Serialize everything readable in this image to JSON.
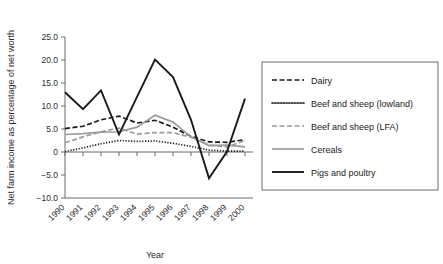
{
  "chart_data": {
    "type": "line",
    "title": "",
    "xlabel": "Year",
    "ylabel": "Net farm income as percentage of net worth",
    "x": [
      1990,
      1991,
      1992,
      1993,
      1994,
      1995,
      1996,
      1997,
      1998,
      1999,
      2000
    ],
    "categories": [
      "1990",
      "1991",
      "1992",
      "1993",
      "1994",
      "1995",
      "1996",
      "1997",
      "1998",
      "1999",
      "2000"
    ],
    "xlim": [
      1990,
      2000
    ],
    "ylim": [
      -10.0,
      25.0
    ],
    "yticks": [
      -10.0,
      -5.0,
      0,
      5.0,
      10.0,
      15.0,
      20.0,
      25.0
    ],
    "ytick_labels": [
      "−10.0",
      "−5.0",
      "0",
      "5.0",
      "10.0",
      "15.0",
      "20.0",
      "25.0"
    ],
    "xtick_labels": [
      "1990",
      "1991",
      "1992",
      "1993",
      "1994",
      "1995",
      "1996",
      "1997",
      "1998",
      "1999",
      "2000"
    ],
    "grid": false,
    "legend_position": "right",
    "series": [
      {
        "name": "Dairy",
        "style": "dashed",
        "color": "#1a1a1a",
        "values": [
          5.1,
          5.6,
          7.0,
          7.8,
          6.3,
          6.9,
          5.4,
          3.4,
          2.2,
          2.1,
          2.7
        ]
      },
      {
        "name": "Beef and sheep (lowland)",
        "style": "dotted",
        "color": "#1a1a1a",
        "values": [
          0.1,
          0.9,
          1.8,
          2.5,
          2.3,
          2.4,
          1.9,
          1.2,
          0.4,
          0.2,
          0.2
        ]
      },
      {
        "name": "Beef and sheep (LFA)",
        "style": "dashed",
        "color": "#9b9b9b",
        "values": [
          2.0,
          3.3,
          4.4,
          5.2,
          3.9,
          4.2,
          4.2,
          3.2,
          1.5,
          1.1,
          2.5
        ]
      },
      {
        "name": "Cereals",
        "style": "solid",
        "color": "#9b9b9b",
        "values": [
          3.8,
          4.0,
          4.3,
          4.4,
          5.4,
          8.0,
          6.5,
          3.3,
          1.4,
          1.5,
          1.1
        ]
      },
      {
        "name": "Pigs and poultry",
        "style": "solid",
        "color": "#1a1a1a",
        "values": [
          13.0,
          9.3,
          13.4,
          3.8,
          12.0,
          20.1,
          16.3,
          7.0,
          -5.7,
          0.1,
          11.6
        ]
      }
    ]
  },
  "legend": {
    "items": [
      {
        "label": "Dairy"
      },
      {
        "label": "Beef and sheep (lowland)"
      },
      {
        "label": "Beef and sheep (LFA)"
      },
      {
        "label": "Cereals"
      },
      {
        "label": "Pigs and poultry"
      }
    ]
  }
}
